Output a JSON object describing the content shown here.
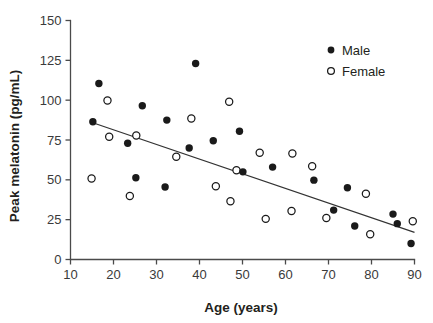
{
  "chart_data": {
    "type": "scatter",
    "title": "",
    "xlabel": "Age (years)",
    "ylabel": "Peak melatonin (pg/mL)",
    "xlim": [
      10,
      90
    ],
    "ylim": [
      0,
      150
    ],
    "xticks": [
      10,
      20,
      30,
      40,
      50,
      60,
      70,
      80,
      90
    ],
    "yticks": [
      0,
      25,
      50,
      75,
      100,
      125,
      150
    ],
    "grid": false,
    "legend_position": "top-right",
    "series": [
      {
        "name": "Male",
        "marker": "filled-circle",
        "color": "#1a1a1a",
        "points": [
          [
            15.2,
            86.5
          ],
          [
            16.6,
            110.5
          ],
          [
            23.3,
            73.0
          ],
          [
            25.2,
            51.3
          ],
          [
            26.7,
            96.5
          ],
          [
            32.0,
            45.5
          ],
          [
            32.4,
            87.5
          ],
          [
            37.6,
            70.0
          ],
          [
            39.1,
            123.0
          ],
          [
            43.2,
            74.5
          ],
          [
            49.3,
            80.5
          ],
          [
            50.1,
            55.0
          ],
          [
            57.0,
            58.0
          ],
          [
            66.6,
            49.8
          ],
          [
            71.2,
            31.0
          ],
          [
            74.4,
            45.0
          ],
          [
            76.1,
            21.0
          ],
          [
            85.0,
            28.5
          ],
          [
            86.0,
            22.5
          ],
          [
            89.2,
            10.0
          ]
        ]
      },
      {
        "name": "Female",
        "marker": "open-circle",
        "color": "#ffffff",
        "points": [
          [
            14.9,
            50.8
          ],
          [
            18.6,
            99.8
          ],
          [
            19.0,
            77.0
          ],
          [
            23.8,
            39.8
          ],
          [
            25.3,
            77.8
          ],
          [
            34.6,
            64.5
          ],
          [
            38.1,
            88.5
          ],
          [
            43.8,
            46.0
          ],
          [
            46.9,
            99.0
          ],
          [
            47.2,
            36.5
          ],
          [
            48.6,
            56.0
          ],
          [
            54.0,
            67.0
          ],
          [
            55.4,
            25.5
          ],
          [
            61.4,
            30.5
          ],
          [
            61.6,
            66.5
          ],
          [
            66.2,
            58.5
          ],
          [
            69.5,
            26.0
          ],
          [
            78.7,
            41.3
          ],
          [
            79.7,
            15.8
          ],
          [
            89.6,
            24.0
          ]
        ]
      }
    ],
    "trendline": {
      "name": "linear-fit",
      "x_start": 14.5,
      "y_start": 86.5,
      "x_end": 90.0,
      "y_end": 17.0
    }
  },
  "legend": {
    "entries": [
      {
        "label": "Male",
        "marker": "filled-circle"
      },
      {
        "label": "Female",
        "marker": "open-circle"
      }
    ]
  },
  "axes": {
    "x_title": "Age (years)",
    "y_title": "Peak melatonin (pg/mL)",
    "x_tick_labels": [
      "10",
      "20",
      "30",
      "40",
      "50",
      "60",
      "70",
      "80",
      "90"
    ],
    "y_tick_labels": [
      "0",
      "25",
      "50",
      "75",
      "100",
      "125",
      "150"
    ]
  },
  "caption": {
    "text": ""
  },
  "colors": {
    "male_marker": "#1a1a1a",
    "female_marker": "#ffffff",
    "axis": "#4a4a4a",
    "trendline": "#333333",
    "background": "#ffffff"
  }
}
